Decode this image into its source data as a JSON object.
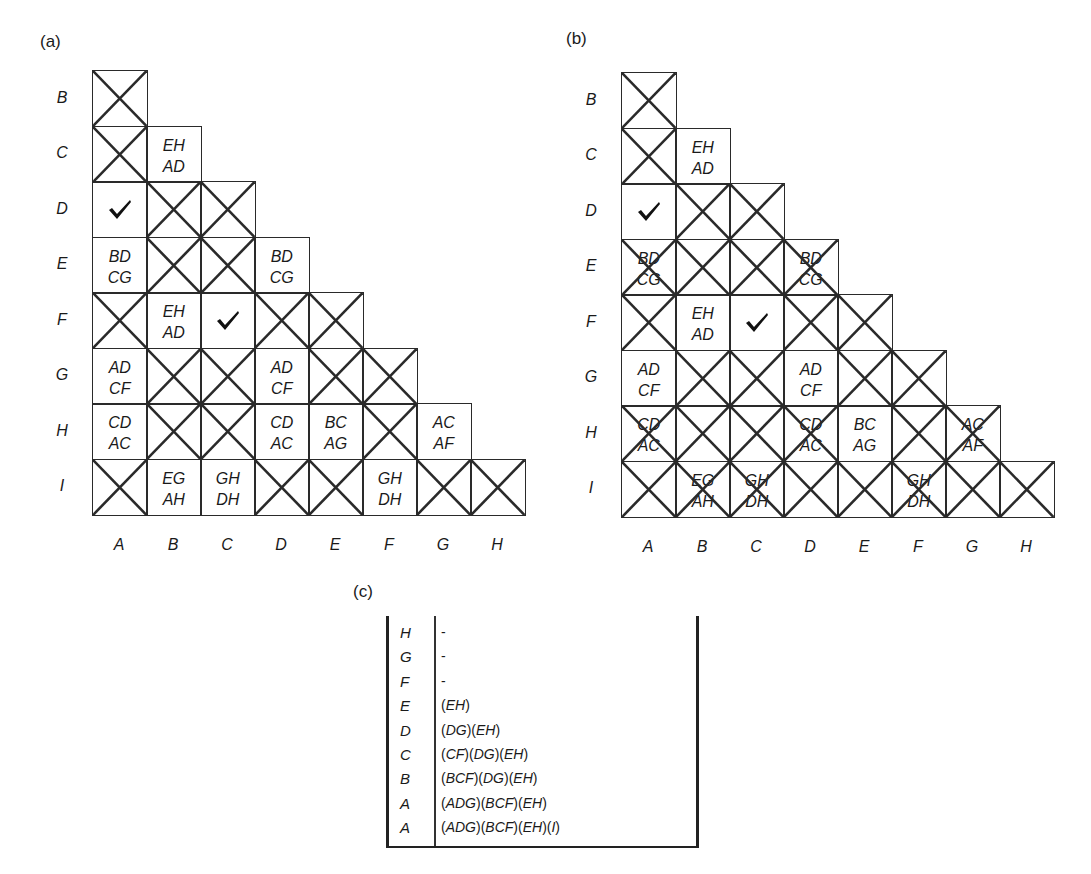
{
  "panels": {
    "a": {
      "label": "(a)"
    },
    "b": {
      "label": "(b)"
    },
    "c": {
      "label": "(c)"
    }
  },
  "grid": {
    "row_labels": [
      "B",
      "C",
      "D",
      "E",
      "F",
      "G",
      "H",
      "I"
    ],
    "col_labels": [
      "A",
      "B",
      "C",
      "D",
      "E",
      "F",
      "G",
      "H"
    ]
  },
  "grid_a": {
    "rows": [
      [
        {
          "x": true
        }
      ],
      [
        {
          "x": true
        },
        {
          "t": [
            "EH",
            "AD"
          ]
        }
      ],
      [
        {
          "check": true
        },
        {
          "x": true
        },
        {
          "x": true
        }
      ],
      [
        {
          "t": [
            "BD",
            "CG"
          ]
        },
        {
          "x": true
        },
        {
          "x": true
        },
        {
          "t": [
            "BD",
            "CG"
          ]
        }
      ],
      [
        {
          "x": true
        },
        {
          "t": [
            "EH",
            "AD"
          ]
        },
        {
          "check": true
        },
        {
          "x": true
        },
        {
          "x": true
        }
      ],
      [
        {
          "t": [
            "AD",
            "CF"
          ]
        },
        {
          "x": true
        },
        {
          "x": true
        },
        {
          "t": [
            "AD",
            "CF"
          ]
        },
        {
          "x": true
        },
        {
          "x": true
        }
      ],
      [
        {
          "t": [
            "CD",
            "AC"
          ]
        },
        {
          "x": true
        },
        {
          "x": true
        },
        {
          "t": [
            "CD",
            "AC"
          ]
        },
        {
          "t": [
            "BC",
            "AG"
          ]
        },
        {
          "x": true
        },
        {
          "t": [
            "AC",
            "AF"
          ]
        }
      ],
      [
        {
          "x": true
        },
        {
          "t": [
            "EG",
            "AH"
          ]
        },
        {
          "t": [
            "GH",
            "DH"
          ]
        },
        {
          "x": true
        },
        {
          "x": true
        },
        {
          "t": [
            "GH",
            "DH"
          ]
        },
        {
          "x": true
        },
        {
          "x": true
        }
      ]
    ]
  },
  "grid_b": {
    "rows": [
      [
        {
          "x": true
        }
      ],
      [
        {
          "x": true
        },
        {
          "t": [
            "EH",
            "AD"
          ]
        }
      ],
      [
        {
          "check": true
        },
        {
          "x": true
        },
        {
          "x": true
        }
      ],
      [
        {
          "x": true,
          "t": [
            "BD",
            "CG"
          ]
        },
        {
          "x": true
        },
        {
          "x": true
        },
        {
          "x": true,
          "t": [
            "BD",
            "CG"
          ]
        }
      ],
      [
        {
          "x": true
        },
        {
          "t": [
            "EH",
            "AD"
          ]
        },
        {
          "check": true
        },
        {
          "x": true
        },
        {
          "x": true
        }
      ],
      [
        {
          "t": [
            "AD",
            "CF"
          ]
        },
        {
          "x": true
        },
        {
          "x": true
        },
        {
          "t": [
            "AD",
            "CF"
          ]
        },
        {
          "x": true
        },
        {
          "x": true
        }
      ],
      [
        {
          "x": true,
          "t": [
            "CD",
            "AC"
          ]
        },
        {
          "x": true
        },
        {
          "x": true
        },
        {
          "x": true,
          "t": [
            "CD",
            "AC"
          ]
        },
        {
          "t": [
            "BC",
            "AG"
          ]
        },
        {
          "x": true
        },
        {
          "x": true,
          "t": [
            "AC",
            "AF"
          ]
        }
      ],
      [
        {
          "x": true
        },
        {
          "x": true,
          "t": [
            "EG",
            "AH"
          ]
        },
        {
          "x": true,
          "t": [
            "GH",
            "DH"
          ]
        },
        {
          "x": true
        },
        {
          "x": true
        },
        {
          "x": true,
          "t": [
            "GH",
            "DH"
          ]
        },
        {
          "x": true
        },
        {
          "x": true
        }
      ]
    ]
  },
  "table_c": {
    "rows": [
      {
        "key": "H",
        "value": "-"
      },
      {
        "key": "G",
        "value": "-"
      },
      {
        "key": "F",
        "value": "-"
      },
      {
        "key": "E",
        "value": "(EH)"
      },
      {
        "key": "D",
        "value": "(DG)(EH)"
      },
      {
        "key": "C",
        "value": "(CF)(DG)(EH)"
      },
      {
        "key": "B",
        "value": "(BCF)(DG)(EH)"
      },
      {
        "key": "A",
        "value": "(ADG)(BCF)(EH)"
      },
      {
        "key": "A",
        "value": "(ADG)(BCF)(EH)(I)"
      }
    ]
  },
  "colors": {
    "line": "#2a2a2a",
    "text": "#1a1a1a",
    "background": "#ffffff"
  }
}
